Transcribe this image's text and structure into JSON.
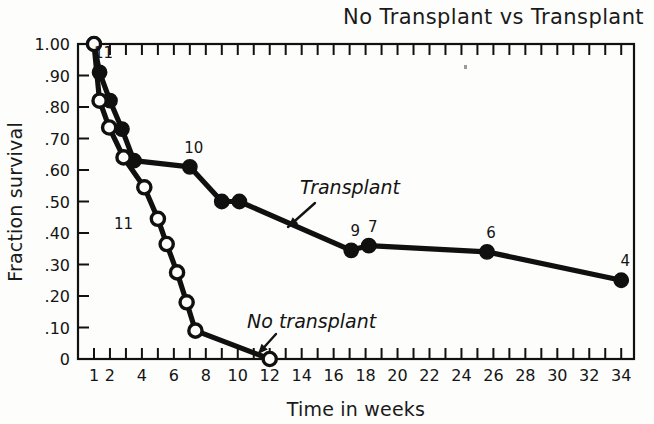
{
  "chart_data": {
    "type": "line",
    "title": "No Transplant vs Transplant",
    "xlabel": "Time in weeks",
    "ylabel": "Fraction survival",
    "xlim": [
      0,
      35
    ],
    "ylim": [
      0,
      1.0
    ],
    "grid": false,
    "legend_position": "inline-annotations",
    "x_tick_labels": [
      "1",
      "2",
      "4",
      "6",
      "8",
      "10",
      "12",
      "14",
      "16",
      "18",
      "20",
      "22",
      "24",
      "26",
      "28",
      "30",
      "32",
      "34"
    ],
    "x_tick_values": [
      1,
      2,
      4,
      6,
      8,
      10,
      12,
      14,
      16,
      18,
      20,
      22,
      24,
      26,
      28,
      30,
      32,
      34
    ],
    "x_minor_ticks_every": 1,
    "y_tick_labels": [
      "1.00",
      ".90",
      ".80",
      ".70",
      ".60",
      ".50",
      ".40",
      ".30",
      ".20",
      ".10",
      "0"
    ],
    "y_tick_values": [
      1.0,
      0.9,
      0.8,
      0.7,
      0.6,
      0.5,
      0.4,
      0.3,
      0.2,
      0.1,
      0.0
    ],
    "series": [
      {
        "name": "Transplant",
        "marker": "filled-circle",
        "x": [
          1.0,
          1.35,
          2.0,
          2.75,
          3.5,
          7.0,
          9.0,
          10.1,
          17.1,
          18.2,
          25.6,
          34.0
        ],
        "values": [
          1.0,
          0.91,
          0.82,
          0.73,
          0.63,
          0.61,
          0.5,
          0.5,
          0.345,
          0.36,
          0.34,
          0.25
        ],
        "point_labels": [
          {
            "x": 1.35,
            "y": 0.91,
            "text": "11"
          },
          {
            "x": 7.0,
            "y": 0.61,
            "text": "10"
          },
          {
            "x": 17.1,
            "y": 0.345,
            "text": "9"
          },
          {
            "x": 18.2,
            "y": 0.36,
            "text": "7"
          },
          {
            "x": 25.6,
            "y": 0.34,
            "text": "6"
          },
          {
            "x": 34.0,
            "y": 0.25,
            "text": "4"
          }
        ]
      },
      {
        "name": "No transplant",
        "marker": "open-circle",
        "x": [
          1.0,
          1.35,
          1.95,
          2.85,
          4.15,
          5.0,
          5.55,
          6.2,
          6.8,
          7.35,
          12.0
        ],
        "values": [
          1.0,
          0.82,
          0.735,
          0.64,
          0.545,
          0.445,
          0.365,
          0.275,
          0.18,
          0.09,
          0.0
        ],
        "point_labels": [
          {
            "x": 3.1,
            "y": 0.425,
            "text": "11"
          }
        ]
      }
    ],
    "annotations": [
      {
        "text": "Transplant",
        "text_x": 300,
        "text_y": 194,
        "arrow_from_x": 315,
        "arrow_from_y": 203,
        "arrow_to_x": 288,
        "arrow_to_y": 227,
        "style": "italic"
      },
      {
        "text": "No transplant",
        "text_x": 247,
        "text_y": 328,
        "arrow_from_x": 276,
        "arrow_from_y": 334,
        "arrow_to_x": 258,
        "arrow_to_y": 354,
        "style": "italic"
      }
    ]
  },
  "plot_geometry": {
    "left": 78,
    "right": 634,
    "top": 44,
    "bottom": 359,
    "week_of_left_edge": 0.0,
    "week_of_right_edge": 34.8
  }
}
